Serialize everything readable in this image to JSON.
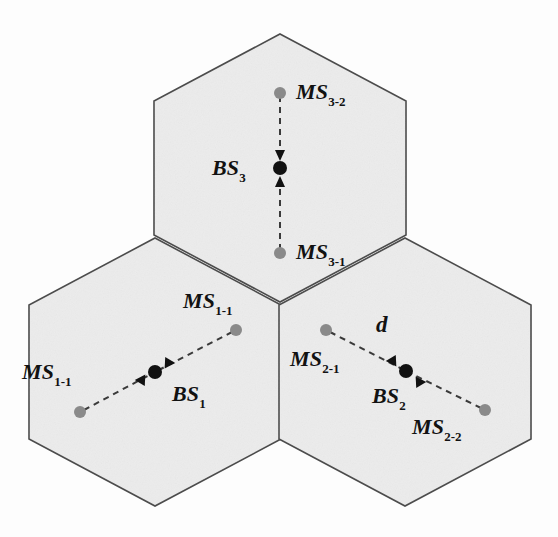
{
  "figure": {
    "background_color": "#fdfdfd",
    "cell_fill_color": "#ececec",
    "cell_stroke_color": "#4a4a4a",
    "ms_dot_color": "#8a8a8a",
    "bs_dot_color": "#111111",
    "link_color": "#3a3a3a"
  },
  "cells": [
    {
      "id": "cell-3",
      "bs_label": {
        "base": "BS",
        "sub": "3"
      },
      "mobiles": [
        {
          "id": "ms-3-2",
          "base": "MS",
          "sub": "3-2"
        },
        {
          "id": "ms-3-1",
          "base": "MS",
          "sub": "3-1"
        }
      ]
    },
    {
      "id": "cell-1",
      "bs_label": {
        "base": "BS",
        "sub": "1"
      },
      "mobiles": [
        {
          "id": "ms-1-1-upper",
          "base": "MS",
          "sub": "1-1"
        },
        {
          "id": "ms-1-1-lower",
          "base": "MS",
          "sub": "1-1"
        }
      ]
    },
    {
      "id": "cell-2",
      "bs_label": {
        "base": "BS",
        "sub": "2"
      },
      "mobiles": [
        {
          "id": "ms-2-1",
          "base": "MS",
          "sub": "2-1"
        },
        {
          "id": "ms-2-2",
          "base": "MS",
          "sub": "2-2"
        }
      ]
    }
  ],
  "annotations": {
    "distance_label": "d"
  }
}
